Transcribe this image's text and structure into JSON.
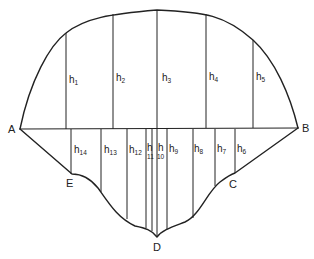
{
  "diagram": {
    "title": "",
    "points": {
      "A": "A",
      "B": "B",
      "C": "C",
      "D": "D",
      "E": "E"
    },
    "upper_ordinates": [
      {
        "base": "h",
        "sub": "1"
      },
      {
        "base": "h",
        "sub": "2"
      },
      {
        "base": "h",
        "sub": "3"
      },
      {
        "base": "h",
        "sub": "4"
      },
      {
        "base": "h",
        "sub": "5"
      }
    ],
    "lower_ordinates": [
      {
        "base": "h",
        "sub": "6"
      },
      {
        "base": "h",
        "sub": "7"
      },
      {
        "base": "h",
        "sub": "8"
      },
      {
        "base": "h",
        "sub": "9"
      },
      {
        "base": "h",
        "sub": "10"
      },
      {
        "base": "h",
        "sub": "11"
      },
      {
        "base": "h",
        "sub": "12"
      },
      {
        "base": "h",
        "sub": "13"
      },
      {
        "base": "h",
        "sub": "14"
      }
    ],
    "stroke_color": "#222222"
  }
}
